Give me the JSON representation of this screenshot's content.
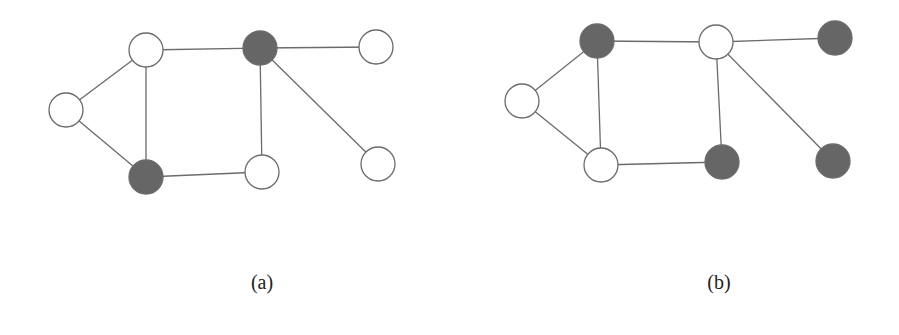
{
  "style": {
    "node_radius": 17,
    "edge_color": "#6b6b6b",
    "node_stroke": "#6b6b6b",
    "fill_white": "#ffffff",
    "fill_dark": "#666666"
  },
  "graphs": [
    {
      "id": "a",
      "caption": "(a)",
      "caption_pos": [
        262,
        284
      ],
      "nodes": [
        {
          "id": "a1",
          "x": 146,
          "y": 50,
          "fill": "white"
        },
        {
          "id": "a2",
          "x": 66,
          "y": 110,
          "fill": "white"
        },
        {
          "id": "a3",
          "x": 146,
          "y": 177,
          "fill": "dark"
        },
        {
          "id": "a4",
          "x": 260,
          "y": 48,
          "fill": "dark"
        },
        {
          "id": "a5",
          "x": 262,
          "y": 172,
          "fill": "white"
        },
        {
          "id": "a6",
          "x": 376,
          "y": 47,
          "fill": "white"
        },
        {
          "id": "a7",
          "x": 378,
          "y": 164,
          "fill": "white"
        }
      ],
      "edges": [
        [
          "a1",
          "a2"
        ],
        [
          "a2",
          "a3"
        ],
        [
          "a1",
          "a3"
        ],
        [
          "a1",
          "a4"
        ],
        [
          "a3",
          "a5"
        ],
        [
          "a4",
          "a5"
        ],
        [
          "a4",
          "a6"
        ],
        [
          "a4",
          "a7"
        ]
      ]
    },
    {
      "id": "b",
      "caption": "(b)",
      "caption_pos": [
        719,
        284
      ],
      "nodes": [
        {
          "id": "b1",
          "x": 597,
          "y": 41,
          "fill": "dark"
        },
        {
          "id": "b2",
          "x": 522,
          "y": 101,
          "fill": "white"
        },
        {
          "id": "b3",
          "x": 601,
          "y": 165,
          "fill": "white"
        },
        {
          "id": "b4",
          "x": 716,
          "y": 42,
          "fill": "white"
        },
        {
          "id": "b5",
          "x": 722,
          "y": 162,
          "fill": "dark"
        },
        {
          "id": "b6",
          "x": 835,
          "y": 38,
          "fill": "dark"
        },
        {
          "id": "b7",
          "x": 833,
          "y": 161,
          "fill": "dark"
        }
      ],
      "edges": [
        [
          "b1",
          "b2"
        ],
        [
          "b2",
          "b3"
        ],
        [
          "b1",
          "b3"
        ],
        [
          "b1",
          "b4"
        ],
        [
          "b3",
          "b5"
        ],
        [
          "b4",
          "b5"
        ],
        [
          "b4",
          "b6"
        ],
        [
          "b4",
          "b7"
        ]
      ]
    }
  ]
}
